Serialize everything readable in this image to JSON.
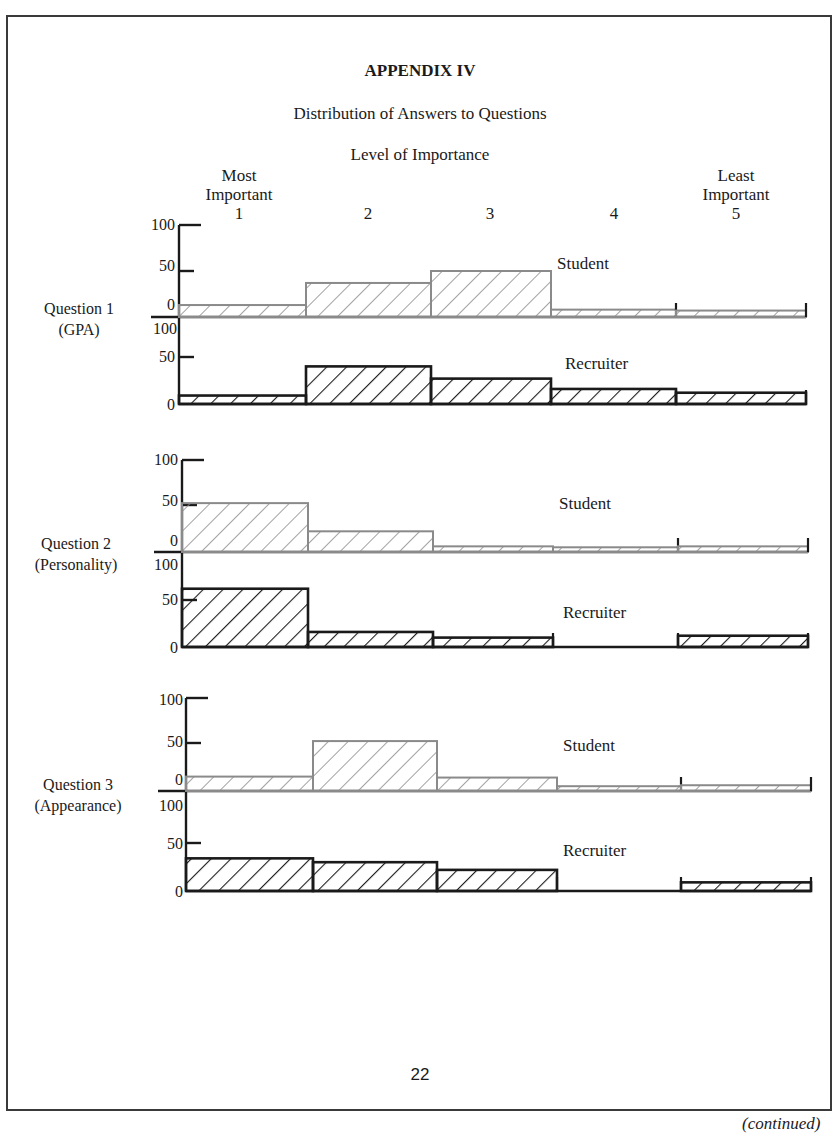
{
  "page": {
    "title": "APPENDIX IV",
    "subtitle": "Distribution of Answers to Questions",
    "axis_title": "Level of Importance",
    "page_number": "22",
    "continued": "(continued)"
  },
  "columns": [
    {
      "top": "Most",
      "mid": "Important",
      "num": "1"
    },
    {
      "top": "",
      "mid": "",
      "num": "2"
    },
    {
      "top": "",
      "mid": "",
      "num": "3"
    },
    {
      "top": "",
      "mid": "",
      "num": "4"
    },
    {
      "top": "Least",
      "mid": "Important",
      "num": "5"
    }
  ],
  "questions": [
    {
      "line1": "Question 1",
      "line2": "(GPA)"
    },
    {
      "line1": "Question 2",
      "line2": "(Personality)"
    },
    {
      "line1": "Question 3",
      "line2": "(Appearance)"
    }
  ],
  "ticks": {
    "t100": "100",
    "t50": "50",
    "t0": "0"
  },
  "series_labels": {
    "student": "Student",
    "recruiter": "Recruiter"
  },
  "colors": {
    "student": "#8a8a8a",
    "recruiter": "#1a1a1a",
    "frame": "#3a3a3a"
  },
  "chart_data": [
    {
      "type": "bar",
      "title": "Question 1 (GPA)",
      "xlabel": "Level of Importance",
      "ylabel": "Percent",
      "categories": [
        "1 (Most Important)",
        "2",
        "3",
        "4",
        "5 (Least Important)"
      ],
      "ylim": [
        0,
        100
      ],
      "yticks": [
        0,
        50,
        100
      ],
      "series": [
        {
          "name": "Student",
          "values": [
            13,
            37,
            50,
            8,
            7
          ]
        },
        {
          "name": "Recruiter",
          "values": [
            9,
            40,
            27,
            16,
            12
          ]
        }
      ],
      "grid": false
    },
    {
      "type": "bar",
      "title": "Question 2 (Personality)",
      "xlabel": "Level of Importance",
      "ylabel": "Percent",
      "categories": [
        "1 (Most Important)",
        "2",
        "3",
        "4",
        "5 (Least Important)"
      ],
      "ylim": [
        0,
        100
      ],
      "yticks": [
        0,
        50,
        100
      ],
      "series": [
        {
          "name": "Student",
          "values": [
            52,
            22,
            6,
            5,
            6
          ]
        },
        {
          "name": "Recruiter",
          "values": [
            62,
            16,
            10,
            0,
            12
          ]
        }
      ],
      "grid": false
    },
    {
      "type": "bar",
      "title": "Question 3 (Appearance)",
      "xlabel": "Level of Importance",
      "ylabel": "Percent",
      "categories": [
        "1 (Most Important)",
        "2",
        "3",
        "4",
        "5 (Least Important)"
      ],
      "ylim": [
        0,
        100
      ],
      "yticks": [
        0,
        50,
        100
      ],
      "series": [
        {
          "name": "Student",
          "values": [
            15,
            52,
            14,
            5,
            6
          ]
        },
        {
          "name": "Recruiter",
          "values": [
            34,
            30,
            22,
            0,
            9
          ]
        }
      ],
      "grid": false
    }
  ]
}
